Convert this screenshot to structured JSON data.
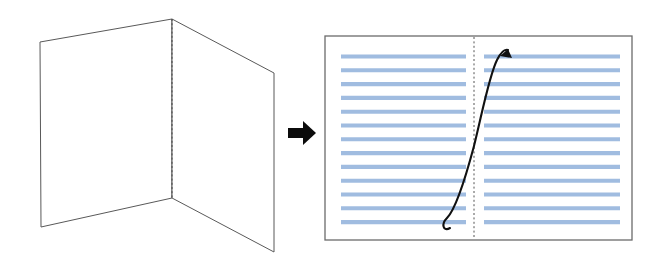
{
  "figure": {
    "background_color": "#ffffff",
    "width": 659,
    "height": 264
  },
  "left_panel_group": {
    "name": "folded-card",
    "description": "Blank card shown folded in three-quarter perspective with a vertical fold crease",
    "outline_color": "#595959",
    "fill_color": "#ffffff",
    "fold_line_color": "#4a4a4a",
    "front_panel_points": "40,42 172,19 172,198 41,227",
    "side_panel_points": "172,19 274,73 274,252 172,198",
    "fold_line": {
      "x": 172,
      "y1": 19,
      "y2": 198
    }
  },
  "transition_arrow": {
    "name": "transition-arrow",
    "direction": "right",
    "color": "#0b0b0b",
    "shaft": {
      "x": 288,
      "y": 128,
      "width": 18,
      "height": 10
    },
    "head_points": "303,121 316,133 303,145"
  },
  "right_panel_group": {
    "name": "open-spread",
    "description": "Opened card shown flat as a two page spread filled with ruled text lines and a page-turn arrow",
    "border_color": "#6b6b6b",
    "fill_color": "#ffffff",
    "border": {
      "x": 325,
      "y": 36,
      "width": 307,
      "height": 204
    },
    "spine": {
      "x": 474,
      "y1": 37,
      "y2": 239,
      "color": "#555555"
    },
    "text_lines": {
      "color": "#a0bce0",
      "stroke_width": 4.1,
      "count_per_page": 13,
      "first_y": 56.5,
      "spacing": 13.8,
      "left_page": {
        "x_start": 341,
        "x_end": 466
      },
      "right_page": {
        "x_start": 484,
        "x_end": 620
      }
    },
    "flip_arrow": {
      "name": "page-flip-arrow",
      "color": "#111111",
      "description": "S shaped arrow sweeping from the bottom of the left page up across the spine to the top of the right page",
      "path": "M 450 228 C 443 232 441 224 447 218 C 456 209 466 176 474 146 C 482 114 489 76 497 60 C 501 52 505 49 508 50",
      "head_points": "508,49 500,56 512,58"
    }
  }
}
